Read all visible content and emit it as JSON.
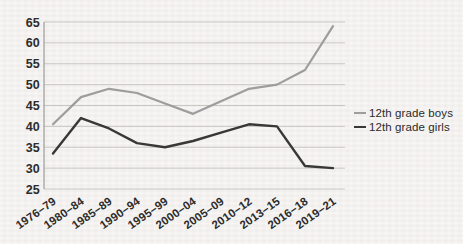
{
  "page": {
    "background": "#f4f2f0"
  },
  "chart_data": {
    "type": "line",
    "title": "",
    "xlabel": "",
    "ylabel": "",
    "categories": [
      "1976–79",
      "1980–84",
      "1985–89",
      "1990–94",
      "1995–99",
      "2000–04",
      "2005–09",
      "2010–12",
      "2013–15",
      "2016–18",
      "2019–21"
    ],
    "series": [
      {
        "name": "12th grade boys",
        "color": "#9d9d9d",
        "stroke_width": 2.2,
        "values": [
          40.5,
          47,
          49,
          48,
          45.5,
          43,
          46,
          49,
          50,
          53.5,
          64
        ]
      },
      {
        "name": "12th grade girls",
        "color": "#383838",
        "stroke_width": 2.4,
        "values": [
          33.5,
          42,
          39.5,
          36,
          35,
          36.5,
          38.5,
          40.5,
          40,
          30.5,
          30
        ]
      }
    ],
    "ylim": [
      25,
      65
    ],
    "yticks": [
      65,
      60,
      55,
      50,
      45,
      40,
      35,
      30,
      25
    ],
    "grid": "horizontal",
    "legend_position": "right-middle",
    "x_tick_label_rotation_deg": -35
  },
  "colors": {
    "gridline": "#c8c6c3",
    "axis_line": "#a3a19e",
    "tick_text": "#2c2c2c",
    "legend_text": "#2b2b2b"
  }
}
